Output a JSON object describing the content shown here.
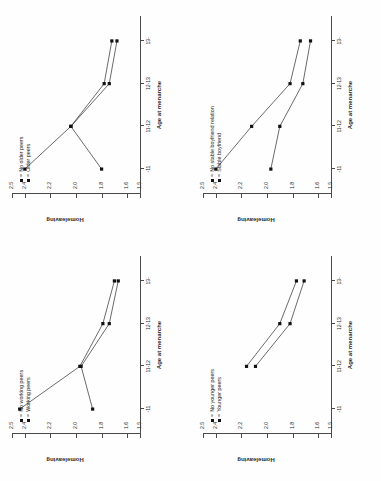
{
  "figure": {
    "orientation": "rotated-90-ccw",
    "panel_count": 4
  },
  "axes": {
    "y_title": "Homeleaving",
    "x_title": "Age at menarche",
    "x_ticks": [
      "-11",
      "11-12",
      "12-13",
      "13-"
    ],
    "y_ticks": [
      "2.5",
      "2.4",
      "2.3",
      "2.2",
      "2.1",
      "2.0",
      "1.9",
      "1.8",
      "1.7",
      "1.6",
      "1.5"
    ],
    "y_ticks_shown": [
      "2.5",
      "2.4",
      "2.2",
      "2.0",
      "1.8",
      "1.6",
      "1.5"
    ],
    "marker_symbol": "■",
    "legend_separator": "=",
    "line_color": "#2b2b2b",
    "marker_color": "#111111"
  },
  "chart_data": [
    {
      "id": "panel-younger-peers",
      "position": "top-left",
      "type": "line",
      "title": "",
      "xlabel": "Age at menarche",
      "ylabel": "Homeleaving",
      "categories": [
        "-11",
        "11-12",
        "12-13",
        "13-"
      ],
      "xlim": [
        0,
        3
      ],
      "ylim": [
        1.5,
        2.5
      ],
      "grid": false,
      "legend_position": "top-left",
      "series": [
        {
          "name": "No younger peers",
          "marker": "■",
          "values": [
            null,
            2.16,
            1.9,
            1.77
          ]
        },
        {
          "name": "Younger peers",
          "marker": "■",
          "values": [
            null,
            2.09,
            1.82,
            1.71
          ]
        }
      ]
    },
    {
      "id": "panel-older-peers",
      "position": "top-right",
      "type": "line",
      "title": "",
      "xlabel": "Age at menarche",
      "ylabel": "Homeleaving",
      "categories": [
        "-11",
        "11-12",
        "12-13",
        "13-"
      ],
      "xlim": [
        0,
        3
      ],
      "ylim": [
        1.5,
        2.5
      ],
      "grid": false,
      "legend_position": "top-left",
      "series": [
        {
          "name": "No older peers",
          "marker": "■",
          "values": [
            2.4,
            2.04,
            1.78,
            1.72
          ]
        },
        {
          "name": "Older peers",
          "marker": "■",
          "values": [
            1.8,
            2.04,
            1.74,
            1.68
          ]
        }
      ]
    },
    {
      "id": "panel-working-peers",
      "position": "bottom-left",
      "type": "line",
      "title": "",
      "xlabel": "Age at menarche",
      "ylabel": "Homeleaving",
      "categories": [
        "-11",
        "11-12",
        "12-13",
        "13-"
      ],
      "xlim": [
        0,
        3
      ],
      "ylim": [
        1.5,
        2.5
      ],
      "grid": false,
      "legend_position": "top-left",
      "series": [
        {
          "name": "No working peers",
          "marker": "■",
          "values": [
            2.44,
            1.97,
            1.79,
            1.7
          ]
        },
        {
          "name": "Working peers",
          "marker": "■",
          "values": [
            1.87,
            1.96,
            1.74,
            1.67
          ]
        }
      ]
    },
    {
      "id": "panel-boyfriend",
      "position": "bottom-right",
      "type": "line",
      "title": "",
      "xlabel": "Age at menarche",
      "ylabel": "Homeleaving",
      "categories": [
        "-11",
        "11-12",
        "12-13",
        "13-"
      ],
      "xlim": [
        0,
        3
      ],
      "ylim": [
        1.5,
        2.5
      ],
      "grid": false,
      "legend_position": "top-left",
      "series": [
        {
          "name": "No stable boyfriend relation",
          "marker": "■",
          "values": [
            2.4,
            2.12,
            1.82,
            1.74
          ]
        },
        {
          "name": "Stable boyfriend",
          "marker": "■",
          "values": [
            1.97,
            1.9,
            1.72,
            1.66
          ]
        }
      ]
    }
  ]
}
